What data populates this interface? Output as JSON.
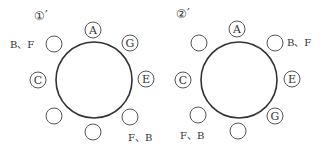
{
  "diagrams": [
    {
      "label": "①′",
      "table": {
        "cx": 94,
        "cy": 80,
        "r": 38
      },
      "seats": [
        {
          "cx": 93,
          "cy": 30,
          "label": "A"
        },
        {
          "cx": 130,
          "cy": 43,
          "label": "G"
        },
        {
          "cx": 146,
          "cy": 79,
          "label": "E"
        },
        {
          "cx": 130,
          "cy": 117,
          "label": ""
        },
        {
          "cx": 93,
          "cy": 132,
          "label": ""
        },
        {
          "cx": 54,
          "cy": 116,
          "label": ""
        },
        {
          "cx": 38,
          "cy": 80,
          "label": "C"
        },
        {
          "cx": 54,
          "cy": 44,
          "label": ""
        }
      ],
      "annotations": [
        {
          "x": 10,
          "y": 48,
          "text": "B、F"
        },
        {
          "x": 128,
          "y": 141,
          "text": "F、B"
        }
      ],
      "label_pos": {
        "x": 34,
        "y": 20
      }
    },
    {
      "label": "②′",
      "table": {
        "cx": 239,
        "cy": 80,
        "r": 38
      },
      "seats": [
        {
          "cx": 237,
          "cy": 29,
          "label": "A"
        },
        {
          "cx": 275,
          "cy": 43,
          "label": ""
        },
        {
          "cx": 292,
          "cy": 79,
          "label": "E"
        },
        {
          "cx": 275,
          "cy": 116,
          "label": "G"
        },
        {
          "cx": 238,
          "cy": 131,
          "label": ""
        },
        {
          "cx": 198,
          "cy": 115,
          "label": ""
        },
        {
          "cx": 183,
          "cy": 80,
          "label": "C"
        },
        {
          "cx": 199,
          "cy": 43,
          "label": ""
        }
      ],
      "annotations": [
        {
          "x": 287,
          "y": 46,
          "text": "B、F"
        },
        {
          "x": 180,
          "y": 139,
          "text": "F、B"
        }
      ],
      "label_pos": {
        "x": 176,
        "y": 18
      }
    }
  ]
}
